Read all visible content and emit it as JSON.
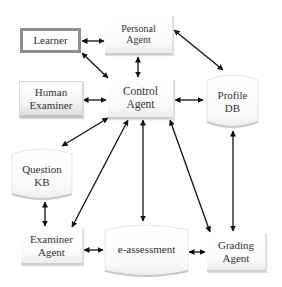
{
  "diagram": {
    "type": "agent architecture",
    "nodes": {
      "personal_agent": {
        "label": "Personal\nAgent",
        "shape": "box"
      },
      "learner": {
        "label": "Learner",
        "shape": "box-thick-border"
      },
      "human_examiner": {
        "label": "Human\nExaminer",
        "shape": "box"
      },
      "control_agent": {
        "label": "Control\nAgent",
        "shape": "box"
      },
      "profile_db": {
        "label": "Profile\nDB",
        "shape": "cylinder"
      },
      "question_kb": {
        "label": "Question\nKB",
        "shape": "cylinder"
      },
      "examiner_agent": {
        "label": "Examiner\nAgent",
        "shape": "box"
      },
      "e_assessment": {
        "label": "e-assessment",
        "shape": "cylinder"
      },
      "grading_agent": {
        "label": "Grading\nAgent",
        "shape": "box"
      }
    },
    "edges": [
      {
        "from": "Learner",
        "to": "Personal Agent",
        "direction": "both"
      },
      {
        "from": "Learner",
        "to": "Control Agent",
        "direction": "both"
      },
      {
        "from": "Personal Agent",
        "to": "Control Agent",
        "direction": "both"
      },
      {
        "from": "Personal Agent",
        "to": "Profile DB",
        "direction": "both"
      },
      {
        "from": "Human Examiner",
        "to": "Control Agent",
        "direction": "both"
      },
      {
        "from": "Control Agent",
        "to": "Profile DB",
        "direction": "both"
      },
      {
        "from": "Control Agent",
        "to": "Question KB",
        "direction": "both"
      },
      {
        "from": "Control Agent",
        "to": "Examiner Agent",
        "direction": "both"
      },
      {
        "from": "Control Agent",
        "to": "e-assessment",
        "direction": "both"
      },
      {
        "from": "Control Agent",
        "to": "Grading Agent",
        "direction": "both"
      },
      {
        "from": "Profile DB",
        "to": "Grading Agent",
        "direction": "both"
      },
      {
        "from": "Question KB",
        "to": "Examiner Agent",
        "direction": "both"
      },
      {
        "from": "Examiner Agent",
        "to": "e-assessment",
        "direction": "both"
      },
      {
        "from": "e-assessment",
        "to": "Grading Agent",
        "direction": "both"
      }
    ]
  }
}
